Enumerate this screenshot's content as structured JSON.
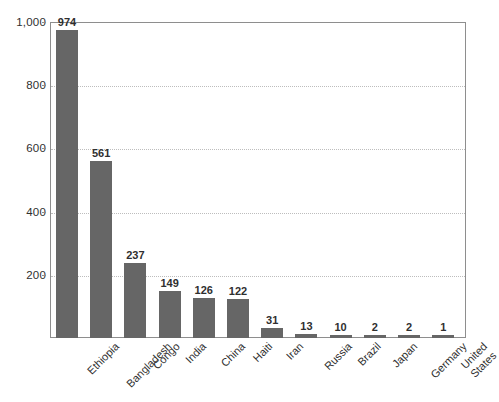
{
  "chart_data": {
    "type": "bar",
    "title": "",
    "subtitle": "",
    "xlabel": "",
    "ylabel": "",
    "ylim": [
      0,
      1000
    ],
    "grid": true,
    "legend": false,
    "orientation": "vertical",
    "bar_color": "#666666",
    "plot_border_color": "#8e8e8e",
    "gridline_color": "#bdbdbd",
    "background_color": "#ffffff",
    "label_rotation_deg": -45,
    "categories": [
      "Ethiopia",
      "Bangladesh",
      "Congo",
      "India",
      "China",
      "Haiti",
      "Iran",
      "Russia",
      "Brazil",
      "Japan",
      "Germany",
      "United States"
    ],
    "category_lines": [
      [
        "Ethiopia"
      ],
      [
        "Bangladesh"
      ],
      [
        "Congo"
      ],
      [
        "India"
      ],
      [
        "China"
      ],
      [
        "Haiti"
      ],
      [
        "Iran"
      ],
      [
        "Russia"
      ],
      [
        "Brazil"
      ],
      [
        "Japan"
      ],
      [
        "Germany"
      ],
      [
        "United",
        "States"
      ]
    ],
    "values": [
      974,
      561,
      237,
      149,
      126,
      122,
      31,
      13,
      10,
      2,
      2,
      1
    ],
    "value_labels": [
      "974",
      "561",
      "237",
      "149",
      "126",
      "122",
      "31",
      "13",
      "10",
      "2",
      "2",
      "1"
    ],
    "yticks": [
      200,
      400,
      600,
      800,
      1000
    ],
    "ytick_labels": [
      "200",
      "400",
      "600",
      "800",
      "1,000"
    ]
  }
}
